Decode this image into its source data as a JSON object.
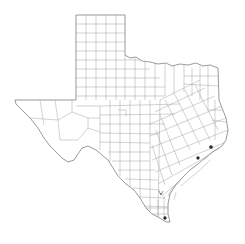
{
  "map": {
    "title": "Texas counties",
    "region": "Texas",
    "style": {
      "background": "#ffffff",
      "border_color": "#6e6e6e",
      "county_line_color": "#9a9a9a",
      "marker_color": "#333333"
    },
    "markers": [
      {
        "name": "marker-1",
        "x": 198,
        "y": 158
      },
      {
        "name": "marker-2",
        "x": 211,
        "y": 147
      },
      {
        "name": "marker-3",
        "x": 165,
        "y": 218
      },
      {
        "name": "marker-4",
        "x": 161,
        "y": 193
      }
    ]
  }
}
